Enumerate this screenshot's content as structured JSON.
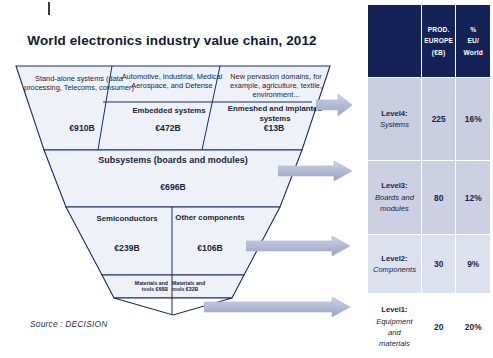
{
  "title": "World electronics industry value chain, 2012",
  "source_note": "Source : DECISION",
  "funnel": {
    "level4": {
      "segments": [
        {
          "descriptor": "Stand-alone systems (data processing, Telecoms, consumer)",
          "name": "",
          "value": "€910B"
        },
        {
          "descriptor": "Automotive, Industrial, Medical Aerospace, and Defense",
          "name": "Embedded systems",
          "value": "€472B"
        },
        {
          "descriptor": "New pervasion domains, for example, agriculture, textile, environment...",
          "name": "Enmeshed and implanted systems",
          "value": "€13B"
        }
      ]
    },
    "level3": {
      "name": "Subsystems (boards and modules)",
      "value": "€696B"
    },
    "level2": {
      "segments": [
        {
          "name": "Semiconductors",
          "value": "€239B"
        },
        {
          "name": "Other components",
          "value": "€106B"
        }
      ]
    },
    "level1": {
      "segments": [
        {
          "name": "Materials and tools",
          "value": "€68B"
        },
        {
          "name": "Materials and tools",
          "value": "€32B"
        }
      ]
    }
  },
  "table": {
    "headers": [
      "",
      "PROD. EUROPE (€B)",
      "% EU/ World"
    ],
    "header_col2_lines": [
      "PROD.",
      "EUROPE",
      "(€B)"
    ],
    "header_col3_lines": [
      "%",
      "EU/",
      "World"
    ],
    "rows": [
      {
        "level": "Level4:",
        "descriptor": "Systems",
        "descriptor_lines": [
          "Systems"
        ],
        "prod_europe": "225",
        "pct_eu_world": "16%"
      },
      {
        "level": "Level3:",
        "descriptor": "Boards and modules",
        "descriptor_lines": [
          "Boards and",
          "modules"
        ],
        "prod_europe": "80",
        "pct_eu_world": "12%"
      },
      {
        "level": "Level2:",
        "descriptor": "Components",
        "descriptor_lines": [
          "Components"
        ],
        "prod_europe": "30",
        "pct_eu_world": "9%"
      },
      {
        "level": "Level1:",
        "descriptor": "Equipment and materials",
        "descriptor_lines": [
          "Equipment",
          "and",
          "materials"
        ],
        "prod_europe": "20",
        "pct_eu_world": "20%"
      }
    ]
  },
  "colors": {
    "header_navy": "#132357",
    "funnel_fill": "#eef2f8",
    "funnel_stroke": "#1b2a63",
    "arrow_fill": "#b6bcd6",
    "row4": "#c8cde0",
    "row3": "#ccd0e2",
    "row2": "#dde1ee",
    "row1": "#ffffff"
  },
  "arrows": [
    {
      "name": "arrow-level4"
    },
    {
      "name": "arrow-level3"
    },
    {
      "name": "arrow-level2"
    },
    {
      "name": "arrow-level1"
    }
  ]
}
